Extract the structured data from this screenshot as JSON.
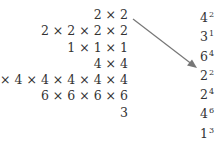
{
  "left_expressions": [
    "2 × 2",
    "2 × 2 × 2 × 2",
    "1 × 1 × 1",
    "4 × 4",
    "4 × 4 × 4 × 4 × 4 × 4",
    "6 × 6 × 6 × 6",
    "3"
  ],
  "right_powers": [
    {
      "base": "4",
      "exp": "2"
    },
    {
      "base": "3",
      "exp": "1"
    },
    {
      "base": "6",
      "exp": "4"
    },
    {
      "base": "2",
      "exp": "2"
    },
    {
      "base": "2",
      "exp": "4"
    },
    {
      "base": "4",
      "exp": "6"
    },
    {
      "base": "1",
      "exp": "3"
    }
  ],
  "arrow": {
    "from": "2 × 2",
    "to": "2^2",
    "color": "#777777"
  }
}
